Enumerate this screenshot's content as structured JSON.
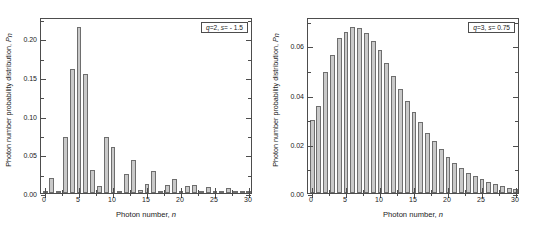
{
  "figure": {
    "axis_labels": {
      "x": "Photon number, ",
      "x_italic": "n",
      "y": "Photon number probability distribution, ",
      "y_italic": "P",
      "y_sub": "n"
    }
  },
  "chart_data": [
    {
      "type": "bar",
      "panel": "left",
      "title": "",
      "legend_label": "q=2, s= - 1.5",
      "legend_q": "q",
      "legend_text": "=2, ",
      "legend_s": "s",
      "legend_text2": "= - 1.5",
      "xlabel": "Photon number, n",
      "ylabel": "Photon number probability distribution, P_n",
      "xlim": [
        -0.6,
        30.6
      ],
      "ylim": [
        0.0,
        0.2275
      ],
      "grid": false,
      "legend_position": "top-right",
      "xticks": [
        0,
        5,
        10,
        15,
        20,
        25,
        30
      ],
      "xtick_labels": [
        "0",
        "5",
        "10",
        "15",
        "20",
        "25",
        "30"
      ],
      "yticks": [
        0.0,
        0.05,
        0.1,
        0.15,
        0.2
      ],
      "ytick_labels": [
        "0.00",
        "0.05",
        "0.10",
        "0.15",
        "0.20"
      ],
      "categories": [
        0,
        1,
        2,
        3,
        4,
        5,
        6,
        7,
        8,
        9,
        10,
        11,
        12,
        13,
        14,
        15,
        16,
        17,
        18,
        19,
        20,
        21,
        22,
        23,
        24,
        25,
        26,
        27,
        28,
        29,
        30
      ],
      "values": [
        0.002,
        0.02,
        0.0005,
        0.072,
        0.16,
        0.215,
        0.154,
        0.03,
        0.009,
        0.073,
        0.059,
        0.0015,
        0.025,
        0.043,
        0.0045,
        0.012,
        0.029,
        0.003,
        0.01,
        0.018,
        0.0015,
        0.009,
        0.01,
        0.0005,
        0.008,
        0.0015,
        0.0008,
        0.007,
        0.0003,
        0.001,
        0.002
      ]
    },
    {
      "type": "bar",
      "panel": "right",
      "title": "",
      "legend_label": "q=3, s= 0.75",
      "legend_q": "q",
      "legend_text": "=3, ",
      "legend_s": "s",
      "legend_text2": "= 0.75",
      "xlabel": "Photon number, n",
      "ylabel": "Photon number probability distribution, P_n",
      "xlim": [
        -0.6,
        30.6
      ],
      "ylim": [
        0.0,
        0.0715
      ],
      "grid": false,
      "legend_position": "top-right",
      "xticks": [
        0,
        5,
        10,
        15,
        20,
        25,
        30
      ],
      "xtick_labels": [
        "0",
        "5",
        "10",
        "15",
        "20",
        "25",
        "30"
      ],
      "yticks": [
        0.0,
        0.02,
        0.04,
        0.06
      ],
      "ytick_labels": [
        "0.00",
        "0.02",
        "0.04",
        "0.06"
      ],
      "categories": [
        0,
        1,
        2,
        3,
        4,
        5,
        6,
        7,
        8,
        9,
        10,
        11,
        12,
        13,
        14,
        15,
        16,
        17,
        18,
        19,
        20,
        21,
        22,
        23,
        24,
        25,
        26,
        27,
        28,
        29,
        30
      ],
      "values": [
        0.0295,
        0.0352,
        0.049,
        0.0562,
        0.063,
        0.0655,
        0.0675,
        0.067,
        0.0652,
        0.0618,
        0.058,
        0.0527,
        0.0474,
        0.0424,
        0.0372,
        0.033,
        0.0287,
        0.0245,
        0.021,
        0.0178,
        0.0148,
        0.0121,
        0.01,
        0.0082,
        0.0068,
        0.0056,
        0.0046,
        0.0036,
        0.0029,
        0.0021,
        0.0017
      ]
    }
  ]
}
